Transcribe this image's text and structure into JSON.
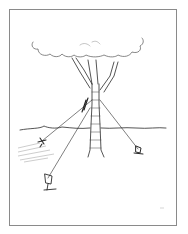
{
  "illustration": {
    "subject": "tree staked with guy ropes",
    "style": "black line drawing",
    "colors": {
      "background": "#ffffff",
      "frame": "#8a8a8a",
      "ink": "#2a2a2a",
      "hatch": "#9a9a9a"
    },
    "elements": [
      "tree-canopy",
      "tree-trunk",
      "branches",
      "ground-line",
      "guy-ropes",
      "stakes",
      "ground-hatching"
    ]
  }
}
